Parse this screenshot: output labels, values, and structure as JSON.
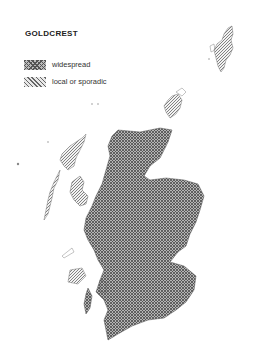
{
  "map": {
    "title": "GOLDCREST",
    "region": "Scotland",
    "legend": [
      {
        "key": "widespread",
        "label": "widespread",
        "pattern": "cross-hatch",
        "color": "#555555"
      },
      {
        "key": "local",
        "label": "local or sporadic",
        "pattern": "diagonal-hatch",
        "color": "#666666"
      }
    ]
  }
}
